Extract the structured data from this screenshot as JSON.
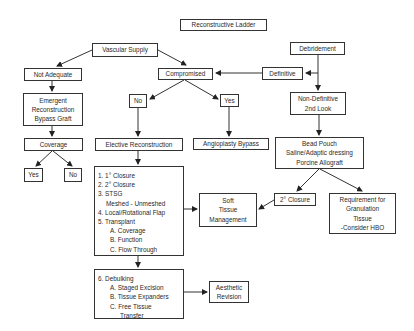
{
  "diagram": {
    "title": "Reconstructive Ladder",
    "nodes": {
      "vascular_supply": "Vascular Supply",
      "debridement": "Debridement",
      "not_adequate": "Not Adequate",
      "compromised": "Compromised",
      "definitive": "Definitive",
      "no_mid": "No",
      "yes_mid": "Yes",
      "non_definitive": [
        "Non-Definitive",
        "2nd Look"
      ],
      "emergent": [
        "Emergent",
        "Reconstruction",
        "Bypass Graft"
      ],
      "coverage": "Coverage",
      "elective_reconstruction": "Elective Reconstruction",
      "angioplasty_bypass": "Angioplasty Bypass",
      "bead_pouch": [
        "Bead Pouch",
        "Saline/Adaptic dressing",
        "Porcine Allograft"
      ],
      "yes_left": "Yes",
      "no_left": "No",
      "ladder_steps": [
        "1. 1° Closure",
        "2. 2° Closure",
        "3. STSG",
        "Meshed - Unmeshed",
        "4. Local/Rotational Flap",
        "5. Transplant",
        "A. Coverage",
        "B. Function",
        "C. Flow Through"
      ],
      "soft_tissue": [
        "Soft",
        "Tissue",
        "Management"
      ],
      "secondary_closure": "2° Closure",
      "granulation": [
        "Requirement for",
        "Granulation",
        "Tissue",
        "-Consider HBO"
      ],
      "debulking": [
        "6. Debulking",
        "A. Staged Excision",
        "B. Tissue Expanders",
        "C. Free Tissue",
        "Transfer"
      ],
      "aesthetic_revision": [
        "Aesthetic",
        "Revision"
      ]
    },
    "edges": [
      [
        "vascular_supply",
        "not_adequate"
      ],
      [
        "vascular_supply",
        "compromised"
      ],
      [
        "debridement",
        "definitive"
      ],
      [
        "debridement",
        "non_definitive"
      ],
      [
        "definitive",
        "compromised"
      ],
      [
        "compromised",
        "no_mid"
      ],
      [
        "compromised",
        "yes_mid"
      ],
      [
        "not_adequate",
        "emergent"
      ],
      [
        "emergent",
        "coverage"
      ],
      [
        "coverage",
        "yes_left"
      ],
      [
        "coverage",
        "no_left"
      ],
      [
        "no_mid",
        "elective_reconstruction"
      ],
      [
        "yes_mid",
        "angioplasty_bypass"
      ],
      [
        "non_definitive",
        "bead_pouch"
      ],
      [
        "elective_reconstruction",
        "ladder_steps"
      ],
      [
        "bead_pouch",
        "secondary_closure"
      ],
      [
        "bead_pouch",
        "granulation"
      ],
      [
        "secondary_closure",
        "soft_tissue"
      ],
      [
        "ladder_steps",
        "soft_tissue"
      ],
      [
        "ladder_steps",
        "debulking"
      ],
      [
        "debulking",
        "aesthetic_revision"
      ]
    ],
    "colors": {
      "line": "#333333",
      "text": "#2a2a2a",
      "background": "#ffffff"
    }
  }
}
